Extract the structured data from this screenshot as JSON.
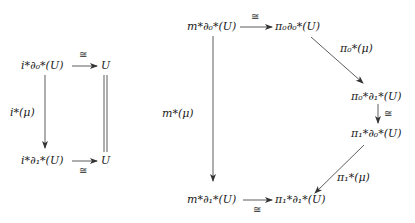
{
  "left_diagram": {
    "nodes": {
      "top_left": "i*∂₀*(U)",
      "top_right": "U",
      "bottom_left": "i*∂₁*(U)",
      "bottom_right": "U"
    },
    "arrows": {
      "top": "≅",
      "left": "i*(μ)",
      "right": "=",
      "bottom": "≅"
    }
  },
  "right_diagram": {
    "nodes": {
      "top_left": "m*∂₀*(U)",
      "top_right": "π₀∂₀*(U)",
      "mid_upper": "π₀*∂₁*(U)",
      "mid_lower": "π₁*∂₀*(U)",
      "bottom_left": "m*∂₁*(U)",
      "bottom_right": "π₁*∂₁*(U)"
    },
    "arrows": {
      "top": "≅",
      "left": "m*(μ)",
      "diag_upper": "π₀*(μ)",
      "vertical_mid": "≅",
      "diag_lower": "π₁*(μ)",
      "bottom": "≅"
    }
  }
}
